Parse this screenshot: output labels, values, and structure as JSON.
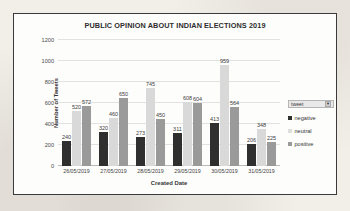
{
  "chart_data": {
    "type": "bar",
    "title": "PUBLIC OPINION ABOUT INDIAN ELECTIONS  2019",
    "xlabel": "Created Date",
    "ylabel": "Number of Tweets",
    "categories": [
      "26/05/2019",
      "27/05/2019",
      "28/05/2019",
      "29/05/2019",
      "30/05/2019",
      "31/05/2019"
    ],
    "series": [
      {
        "name": "negative",
        "color": "#2f2f2f",
        "values": [
          240,
          320,
          273,
          311,
          413,
          206
        ]
      },
      {
        "name": "neutral",
        "color": "#d9d9d9",
        "values": [
          520,
          460,
          745,
          608,
          959,
          348
        ]
      },
      {
        "name": "positive",
        "color": "#9a9a9a",
        "values": [
          572,
          650,
          450,
          604,
          564,
          225
        ]
      }
    ],
    "ylim": [
      0,
      1200
    ],
    "yticks": [
      0,
      200,
      400,
      600,
      800,
      1000,
      1200
    ],
    "grid": true,
    "legend_position": "right",
    "data_labels": true
  },
  "legend": {
    "filter_label": "tweet",
    "filter_caret": "▼",
    "items": [
      {
        "label": "negative"
      },
      {
        "label": "neutral"
      },
      {
        "label": "positive"
      }
    ]
  }
}
